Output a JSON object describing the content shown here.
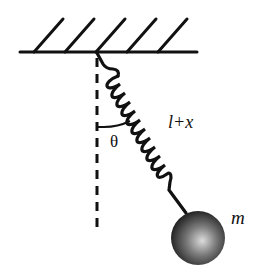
{
  "diagram": {
    "type": "spring-pendulum",
    "labels": {
      "angle": "θ",
      "length": "l+x",
      "mass": "m"
    },
    "colors": {
      "stroke": "#111111",
      "ball_highlight": "#d8d8d8",
      "ball_dark": "#1a1a1a"
    },
    "elements": [
      "fixed ceiling with hatching",
      "vertical dashed reference line",
      "coil spring at angle",
      "angle arc",
      "spherical bob"
    ]
  }
}
